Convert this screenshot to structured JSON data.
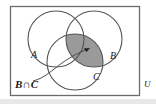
{
  "diagram": {
    "type": "venn-diagram",
    "universe_label": "U",
    "set_labels": [
      {
        "name": "set-a",
        "text": "A"
      },
      {
        "name": "set-b",
        "text": "B"
      },
      {
        "name": "set-c",
        "text": "C"
      }
    ],
    "callout": {
      "text": "B∩C",
      "description": "leader line from label to shaded region"
    },
    "colors": {
      "shade_fill": "#9a9a9a",
      "stroke": "#4a4a4a",
      "border": "#6b6b6b",
      "text": "#1a1a1a",
      "background": "#ffffff",
      "bottom_strip": "#e8e8e8"
    },
    "geometry": {
      "rect": {
        "x": 10,
        "y": 6,
        "width": 130,
        "height": 90
      },
      "circles": [
        {
          "label": "A",
          "cx": 56,
          "cy": 39,
          "r": 28
        },
        {
          "label": "B",
          "cx": 94,
          "cy": 39,
          "r": 28
        },
        {
          "label": "C",
          "cx": 75,
          "cy": 62,
          "r": 28
        }
      ]
    }
  }
}
